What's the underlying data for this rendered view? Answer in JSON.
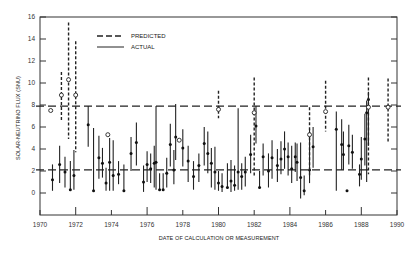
{
  "chart_data": {
    "type": "scatter",
    "title": "",
    "xlabel": "DATE OF CALCULATION OR MEASUREMENT",
    "ylabel": "SOLAR-NEUTRINO FLUX (SNU)",
    "xlim": [
      1970,
      1990
    ],
    "ylim": [
      -2,
      16
    ],
    "x_ticks": [
      1970,
      1972,
      1974,
      1976,
      1978,
      1980,
      1982,
      1984,
      1986,
      1988,
      1990
    ],
    "y_ticks": [
      0,
      2,
      4,
      6,
      8,
      10,
      12,
      14,
      16
    ],
    "grid": false,
    "legend": {
      "position": "upper-left-inside",
      "entries": [
        {
          "label": "PREDICTED",
          "style": "dashed"
        },
        {
          "label": "ACTUAL",
          "style": "solid"
        }
      ]
    },
    "reference_lines": [
      {
        "name": "predicted-average",
        "y": 7.9,
        "style": "dashed"
      },
      {
        "name": "measured-average",
        "y": 2.1,
        "style": "dashed"
      }
    ],
    "series": [
      {
        "name": "PREDICTED",
        "marker": "open-circle",
        "errorbar_style": "dashed",
        "points": [
          {
            "x": 1970.6,
            "y": 7.5,
            "lo": 7.5,
            "hi": 7.5
          },
          {
            "x": 1971.2,
            "y": 8.9,
            "lo": 6.6,
            "hi": 11.0
          },
          {
            "x": 1971.6,
            "y": 10.3,
            "lo": 4.9,
            "hi": 15.5
          },
          {
            "x": 1972.0,
            "y": 8.9,
            "lo": 3.7,
            "hi": 13.8
          },
          {
            "x": 1973.8,
            "y": 5.3,
            "lo": 5.3,
            "hi": 5.3
          },
          {
            "x": 1977.8,
            "y": 4.8,
            "lo": 4.8,
            "hi": 4.8
          },
          {
            "x": 1980.0,
            "y": 7.6,
            "lo": 6.8,
            "hi": 9.3
          },
          {
            "x": 1982.0,
            "y": 7.3,
            "lo": 1.5,
            "hi": 10.5
          },
          {
            "x": 1985.1,
            "y": 5.3,
            "lo": 1.6,
            "hi": 7.8
          },
          {
            "x": 1986.0,
            "y": 7.4,
            "lo": 5.6,
            "hi": 10.2
          },
          {
            "x": 1988.4,
            "y": 7.8,
            "lo": 1.7,
            "hi": 10.5
          },
          {
            "x": 1989.5,
            "y": 7.8,
            "lo": 4.6,
            "hi": 10.4
          }
        ]
      },
      {
        "name": "ACTUAL",
        "marker": "filled-circle",
        "errorbar_style": "solid",
        "points": [
          {
            "x": 1970.7,
            "y": 1.2,
            "lo": 0.2,
            "hi": 2.6
          },
          {
            "x": 1971.1,
            "y": 2.6,
            "lo": 0.9,
            "hi": 4.3
          },
          {
            "x": 1971.4,
            "y": 1.9,
            "lo": 0.5,
            "hi": 3.3
          },
          {
            "x": 1971.7,
            "y": 0.3,
            "lo": 0.3,
            "hi": 2.9
          },
          {
            "x": 1971.9,
            "y": 1.6,
            "lo": 0.3,
            "hi": 3.9
          },
          {
            "x": 1972.7,
            "y": 6.2,
            "lo": 4.2,
            "hi": 7.9
          },
          {
            "x": 1973.0,
            "y": 0.2,
            "lo": 0.2,
            "hi": 5.9
          },
          {
            "x": 1973.3,
            "y": 3.2,
            "lo": 1.3,
            "hi": 5.2
          },
          {
            "x": 1973.5,
            "y": 2.7,
            "lo": 1.4,
            "hi": 4.1
          },
          {
            "x": 1973.7,
            "y": 0.9,
            "lo": 0.2,
            "hi": 2.3
          },
          {
            "x": 1973.9,
            "y": 2.8,
            "lo": 0.2,
            "hi": 5.0
          },
          {
            "x": 1974.1,
            "y": 1.6,
            "lo": 0.2,
            "hi": 4.8
          },
          {
            "x": 1974.4,
            "y": 1.7,
            "lo": 0.8,
            "hi": 2.9
          },
          {
            "x": 1974.7,
            "y": 0.2,
            "lo": 0.2,
            "hi": 2.6
          },
          {
            "x": 1975.1,
            "y": 3.6,
            "lo": 2.0,
            "hi": 5.1
          },
          {
            "x": 1975.4,
            "y": 4.6,
            "lo": 2.5,
            "hi": 6.4
          },
          {
            "x": 1975.8,
            "y": 1.0,
            "lo": 0.1,
            "hi": 2.5
          },
          {
            "x": 1976.0,
            "y": 2.6,
            "lo": 1.0,
            "hi": 3.8
          },
          {
            "x": 1976.2,
            "y": 2.2,
            "lo": 0.9,
            "hi": 3.6
          },
          {
            "x": 1976.4,
            "y": 2.7,
            "lo": 0.5,
            "hi": 4.3
          },
          {
            "x": 1976.5,
            "y": 2.8,
            "lo": 0.3,
            "hi": 7.9
          },
          {
            "x": 1976.7,
            "y": 0.3,
            "lo": 0.3,
            "hi": 1.8
          },
          {
            "x": 1976.9,
            "y": 0.3,
            "lo": 0.3,
            "hi": 1.8
          },
          {
            "x": 1977.1,
            "y": 1.8,
            "lo": 0.5,
            "hi": 3.2
          },
          {
            "x": 1977.3,
            "y": 4.4,
            "lo": 2.4,
            "hi": 6.3
          },
          {
            "x": 1977.5,
            "y": 2.1,
            "lo": 0.8,
            "hi": 3.9
          },
          {
            "x": 1977.6,
            "y": 5.1,
            "lo": 3.0,
            "hi": 8.1
          },
          {
            "x": 1978.0,
            "y": 4.1,
            "lo": 2.4,
            "hi": 5.8
          },
          {
            "x": 1978.3,
            "y": 2.9,
            "lo": 1.0,
            "hi": 4.3
          },
          {
            "x": 1978.6,
            "y": 1.5,
            "lo": 0.3,
            "hi": 2.9
          },
          {
            "x": 1978.9,
            "y": 2.5,
            "lo": 1.0,
            "hi": 3.6
          },
          {
            "x": 1979.2,
            "y": 4.5,
            "lo": 2.5,
            "hi": 6.0
          },
          {
            "x": 1979.4,
            "y": 3.6,
            "lo": 1.8,
            "hi": 5.6
          },
          {
            "x": 1979.6,
            "y": 2.7,
            "lo": 0.5,
            "hi": 4.1
          },
          {
            "x": 1979.8,
            "y": 1.9,
            "lo": 0.3,
            "hi": 4.2
          },
          {
            "x": 1980.0,
            "y": 0.9,
            "lo": 0.2,
            "hi": 2.0
          },
          {
            "x": 1980.2,
            "y": 0.6,
            "lo": 0.1,
            "hi": 1.8
          },
          {
            "x": 1980.5,
            "y": 0.5,
            "lo": 0.5,
            "hi": 2.7
          },
          {
            "x": 1980.7,
            "y": 1.1,
            "lo": 0.1,
            "hi": 3.0
          },
          {
            "x": 1980.9,
            "y": 0.7,
            "lo": 0.2,
            "hi": 2.5
          },
          {
            "x": 1981.1,
            "y": 1.9,
            "lo": 0.3,
            "hi": 7.7
          },
          {
            "x": 1981.3,
            "y": 1.5,
            "lo": 0.3,
            "hi": 2.7
          },
          {
            "x": 1981.5,
            "y": 1.9,
            "lo": 0.6,
            "hi": 3.3
          },
          {
            "x": 1981.8,
            "y": 3.5,
            "lo": 1.8,
            "hi": 5.3
          },
          {
            "x": 1982.1,
            "y": 6.1,
            "lo": 4.5,
            "hi": 7.9
          },
          {
            "x": 1982.3,
            "y": 0.5,
            "lo": 0.5,
            "hi": 2.0
          },
          {
            "x": 1982.5,
            "y": 3.3,
            "lo": 1.6,
            "hi": 4.5
          },
          {
            "x": 1982.8,
            "y": 2.0,
            "lo": 0.5,
            "hi": 3.6
          },
          {
            "x": 1983.0,
            "y": 3.2,
            "lo": 1.3,
            "hi": 4.8
          },
          {
            "x": 1983.3,
            "y": 2.5,
            "lo": 1.0,
            "hi": 4.0
          },
          {
            "x": 1983.5,
            "y": 3.1,
            "lo": 1.7,
            "hi": 4.7
          },
          {
            "x": 1983.7,
            "y": 4.0,
            "lo": 2.2,
            "hi": 5.6
          },
          {
            "x": 1983.9,
            "y": 3.3,
            "lo": 1.6,
            "hi": 4.6
          },
          {
            "x": 1984.1,
            "y": 2.2,
            "lo": 0.9,
            "hi": 4.3
          },
          {
            "x": 1984.3,
            "y": 3.3,
            "lo": 1.9,
            "hi": 4.6
          },
          {
            "x": 1984.4,
            "y": 2.8,
            "lo": 1.1,
            "hi": 4.5
          },
          {
            "x": 1984.6,
            "y": 1.4,
            "lo": -0.5,
            "hi": 4.6
          },
          {
            "x": 1984.8,
            "y": 0.2,
            "lo": -0.2,
            "hi": 1.6
          },
          {
            "x": 1985.1,
            "y": 2.1,
            "lo": 0.9,
            "hi": 5.8
          },
          {
            "x": 1985.3,
            "y": 4.2,
            "lo": 2.3,
            "hi": 6.0
          },
          {
            "x": 1986.6,
            "y": 5.8,
            "lo": 0.2,
            "hi": 7.4
          },
          {
            "x": 1986.9,
            "y": 4.4,
            "lo": 2.1,
            "hi": 6.7
          },
          {
            "x": 1987.0,
            "y": 3.5,
            "lo": 2.1,
            "hi": 5.6
          },
          {
            "x": 1987.2,
            "y": 0.2,
            "lo": 0.2,
            "hi": 0.2
          },
          {
            "x": 1987.3,
            "y": 4.3,
            "lo": 2.6,
            "hi": 6.2
          },
          {
            "x": 1987.5,
            "y": 3.7,
            "lo": 2.2,
            "hi": 5.3
          },
          {
            "x": 1987.9,
            "y": 1.7,
            "lo": 0.6,
            "hi": 2.6
          },
          {
            "x": 1988.0,
            "y": 3.1,
            "lo": 1.2,
            "hi": 5.1
          },
          {
            "x": 1988.2,
            "y": 4.9,
            "lo": 2.5,
            "hi": 7.2
          },
          {
            "x": 1988.3,
            "y": 7.3,
            "lo": 1.0,
            "hi": 8.4
          },
          {
            "x": 1988.4,
            "y": 8.5,
            "lo": 4.3,
            "hi": 9.2
          }
        ]
      }
    ]
  }
}
